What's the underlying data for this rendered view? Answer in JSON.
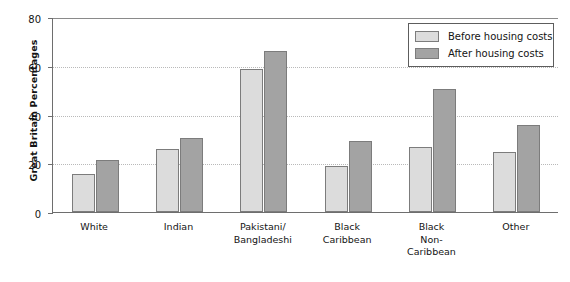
{
  "chart_data": {
    "type": "bar",
    "title": "",
    "xlabel": "",
    "ylabel": "Great Britain Percentages",
    "ylim": [
      0,
      80
    ],
    "yticks": [
      0,
      20,
      40,
      60,
      80
    ],
    "grid": true,
    "legend_position": "top-right",
    "categories": [
      "White",
      "Pakistani/ Bangladeshi",
      "Indian",
      "Black Caribbean",
      "Black Non- Caribbean",
      "Other"
    ],
    "category_lines": [
      [
        "White"
      ],
      [
        "Indian"
      ],
      [
        "Pakistani/",
        "Bangladeshi"
      ],
      [
        "Black",
        "Caribbean"
      ],
      [
        "Black",
        "Non-",
        "Caribbean"
      ],
      [
        "Other"
      ]
    ],
    "series": [
      {
        "name": "Before housing costs",
        "color": "#dcdcdc",
        "values": [
          15.5,
          26,
          58.5,
          19,
          26.5,
          24.5
        ]
      },
      {
        "name": "After housing costs",
        "color": "#a3a3a3",
        "values": [
          21.5,
          30.5,
          66,
          29,
          50.5,
          35.5
        ]
      }
    ]
  },
  "legend": {
    "items": [
      {
        "label": "Before housing costs",
        "swatch": "before"
      },
      {
        "label": "After housing costs",
        "swatch": "after"
      }
    ]
  },
  "axis": {
    "y_title": "Great Britain Percentages",
    "y_tick_labels": [
      "0",
      "20",
      "40",
      "60",
      "80"
    ]
  }
}
